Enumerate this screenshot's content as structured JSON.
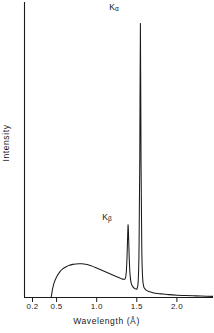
{
  "figure": {
    "background_color": "#ffffff",
    "line_color": "#1a1a1a"
  },
  "axes": {
    "x_title": "Wavelength (Å)",
    "y_title": "Intensity",
    "x_tick_labels": [
      "0.2",
      "0.5",
      "1.0",
      "1.5",
      "2.0"
    ],
    "y_tick_labels": []
  },
  "annotations": {
    "k_alpha": {
      "base": "K",
      "sub": "α"
    },
    "k_beta": {
      "base": "K",
      "sub": "β"
    }
  },
  "chart_data": {
    "type": "line",
    "title": "",
    "xlabel": "Wavelength (Å)",
    "ylabel": "Intensity",
    "xlim": [
      0.1,
      2.45
    ],
    "ylim": [
      0,
      1.0
    ],
    "grid": false,
    "legend": null,
    "xticks": [
      0.2,
      0.5,
      1.0,
      1.5,
      2.0
    ],
    "xtick_labels": [
      "0.2",
      "0.5",
      "1.0",
      "1.5",
      "2.0"
    ],
    "yticks": [],
    "annotations": [
      {
        "text": "Kα",
        "x": 1.545,
        "y": 0.985,
        "peak_height": 0.96
      },
      {
        "text": "Kβ",
        "x": 1.392,
        "y": 0.3,
        "peak_height": 0.255
      }
    ],
    "features": {
      "short_wavelength_cutoff": 0.43,
      "continuum_peak_x": 0.82,
      "continuum_peak_y": 0.118,
      "k_beta_position": 1.392,
      "k_beta_height": 0.255,
      "k_alpha_position": 1.545,
      "k_alpha_height": 0.96
    },
    "series": [
      {
        "name": "X-ray emission spectrum",
        "x": [
          0.1,
          0.2,
          0.3,
          0.4,
          0.425,
          0.435,
          0.45,
          0.47,
          0.5,
          0.54,
          0.58,
          0.62,
          0.66,
          0.7,
          0.74,
          0.78,
          0.82,
          0.86,
          0.9,
          0.95,
          1.0,
          1.05,
          1.1,
          1.15,
          1.2,
          1.25,
          1.3,
          1.33,
          1.355,
          1.368,
          1.378,
          1.386,
          1.392,
          1.398,
          1.406,
          1.416,
          1.43,
          1.45,
          1.47,
          1.49,
          1.505,
          1.518,
          1.528,
          1.537,
          1.545,
          1.553,
          1.562,
          1.572,
          1.585,
          1.6,
          1.62,
          1.65,
          1.7,
          1.76,
          1.83,
          1.9,
          2.0,
          2.1,
          2.2,
          2.3,
          2.45
        ],
        "y": [
          0.0,
          0.0,
          0.0,
          0.0,
          0.0,
          0.005,
          0.03,
          0.052,
          0.072,
          0.09,
          0.101,
          0.108,
          0.113,
          0.116,
          0.1175,
          0.118,
          0.118,
          0.1165,
          0.114,
          0.109,
          0.103,
          0.097,
          0.091,
          0.085,
          0.079,
          0.073,
          0.067,
          0.064,
          0.066,
          0.085,
          0.14,
          0.215,
          0.255,
          0.21,
          0.135,
          0.08,
          0.05,
          0.038,
          0.032,
          0.03,
          0.032,
          0.06,
          0.17,
          0.48,
          0.96,
          0.47,
          0.175,
          0.072,
          0.04,
          0.031,
          0.025,
          0.021,
          0.017,
          0.014,
          0.012,
          0.01,
          0.008,
          0.007,
          0.006,
          0.005,
          0.004
        ]
      }
    ]
  }
}
